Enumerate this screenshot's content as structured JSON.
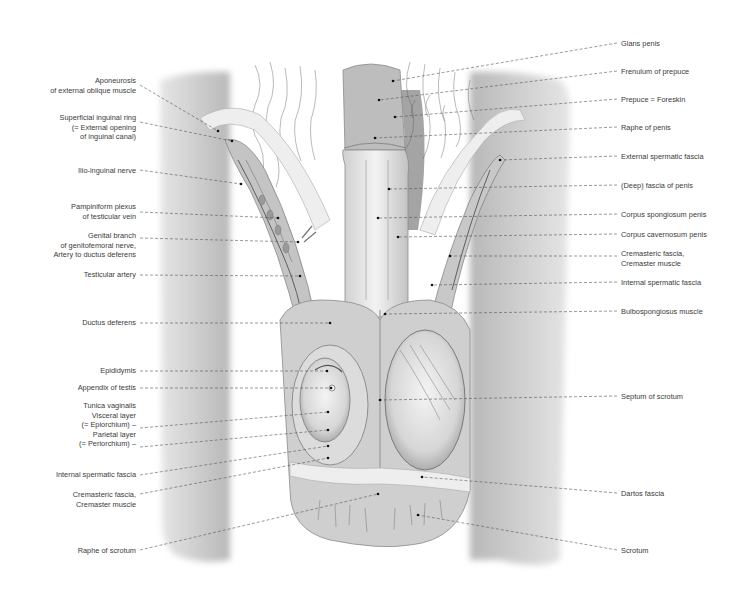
{
  "figure": {
    "title": "",
    "colors": {
      "background": "#ffffff",
      "leader_line": "#555555",
      "skin": "#c9c9c9",
      "text": "#3a3a3a"
    }
  },
  "labels_left": [
    {
      "text": "Aponeurosis\nof external oblique muscle",
      "x": 136,
      "y": 81,
      "tx": 218,
      "ty": 131
    },
    {
      "text": "Superficial inguinal ring\n(= External opening\nof inguinal canal)",
      "x": 136,
      "y": 118,
      "tx": 232,
      "ty": 141
    },
    {
      "text": "Ilio-inguinal nerve",
      "x": 136,
      "y": 166,
      "tx": 241,
      "ty": 184
    },
    {
      "text": "Pampiniform plexus\nof testicular vein",
      "x": 136,
      "y": 202,
      "tx": 278,
      "ty": 218
    },
    {
      "text": "Genital branch\nof genitofemoral nerve,\nArtery to ductus deferens",
      "x": 136,
      "y": 231,
      "tx": 298,
      "ty": 242
    },
    {
      "text": "Testicular artery",
      "x": 136,
      "y": 270,
      "tx": 300,
      "ty": 276
    },
    {
      "text": "Ductus deferens",
      "x": 136,
      "y": 318,
      "tx": 330,
      "ty": 323
    },
    {
      "text": "Epididymis",
      "x": 136,
      "y": 366,
      "tx": 327,
      "ty": 371
    },
    {
      "text": "Appendix of testis",
      "x": 136,
      "y": 383,
      "tx": 331,
      "ty": 388
    },
    {
      "text": "Tunica vaginalis\nVisceral layer\n(= Epiorchium) –\nParietal layer\n(= Periorchium) –",
      "x": 136,
      "y": 403,
      "tx": 328,
      "ty": 412
    },
    {
      "text": "",
      "x": 136,
      "y": 442,
      "tx": 328,
      "ty": 430
    },
    {
      "text": "Internal spermatic fascia",
      "x": 136,
      "y": 470,
      "tx": 328,
      "ty": 446
    },
    {
      "text": "Cremasteric fascia,\nCremaster muscle",
      "x": 136,
      "y": 490,
      "tx": 328,
      "ty": 458
    },
    {
      "text": "Raphe of scrotum",
      "x": 136,
      "y": 546,
      "tx": 378,
      "ty": 494
    }
  ],
  "labels_right": [
    {
      "text": "Glans penis",
      "x": 621,
      "y": 39,
      "tx": 393,
      "ty": 81
    },
    {
      "text": "Frenulum of prepuce",
      "x": 621,
      "y": 67,
      "tx": 379,
      "ty": 100
    },
    {
      "text": "Prepuce = Foreskin",
      "x": 621,
      "y": 95,
      "tx": 395,
      "ty": 117
    },
    {
      "text": "Raphe of penis",
      "x": 621,
      "y": 123,
      "tx": 375,
      "ty": 138
    },
    {
      "text": "External spermatic fascia",
      "x": 621,
      "y": 152,
      "tx": 500,
      "ty": 160
    },
    {
      "text": "(Deep) fascia of penis",
      "x": 621,
      "y": 181,
      "tx": 389,
      "ty": 189
    },
    {
      "text": "Corpus spongiosum penis",
      "x": 621,
      "y": 210,
      "tx": 378,
      "ty": 218
    },
    {
      "text": "Corpus cavernosum penis",
      "x": 621,
      "y": 230,
      "tx": 398,
      "ty": 237
    },
    {
      "text": "Cremasteric fascia,\nCremaster muscle",
      "x": 621,
      "y": 249,
      "tx": 450,
      "ty": 256
    },
    {
      "text": "Internal spermatic fascia",
      "x": 621,
      "y": 278,
      "tx": 432,
      "ty": 285
    },
    {
      "text": "Bulbospongiosus muscle",
      "x": 621,
      "y": 307,
      "tx": 385,
      "ty": 314
    },
    {
      "text": "Septum of scrotum",
      "x": 621,
      "y": 392,
      "tx": 380,
      "ty": 400
    },
    {
      "text": "Dartos fascia",
      "x": 621,
      "y": 489,
      "tx": 422,
      "ty": 477
    },
    {
      "text": "Scrotum",
      "x": 621,
      "y": 546,
      "tx": 418,
      "ty": 515
    }
  ]
}
